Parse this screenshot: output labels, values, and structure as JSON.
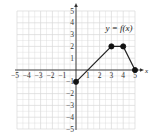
{
  "chart_data": {
    "type": "line",
    "title": "",
    "function_label": "y = f(x)",
    "xlabel": "x",
    "ylabel": "y",
    "xlim": [
      -5,
      5
    ],
    "ylim": [
      -5,
      5
    ],
    "grid": true,
    "x_ticks": [
      -5,
      -4,
      -3,
      -2,
      -1,
      1,
      2,
      3,
      4,
      5
    ],
    "y_ticks": [
      5,
      4,
      3,
      2,
      1,
      -1,
      -2,
      -3,
      -4,
      -5
    ],
    "series": [
      {
        "name": "f(x)",
        "x": [
          0,
          3,
          4,
          5
        ],
        "y": [
          -1,
          2,
          2,
          0
        ],
        "points": [
          {
            "x": 0,
            "y": -1,
            "marker": "closed"
          },
          {
            "x": 3,
            "y": 2,
            "marker": "closed"
          },
          {
            "x": 4,
            "y": 2,
            "marker": "closed"
          },
          {
            "x": 5,
            "y": 0,
            "marker": "closed"
          }
        ]
      }
    ]
  },
  "colors": {
    "grid": "#d8d8d8",
    "axis": "#333333",
    "line": "#222222",
    "marker": "#111111"
  }
}
